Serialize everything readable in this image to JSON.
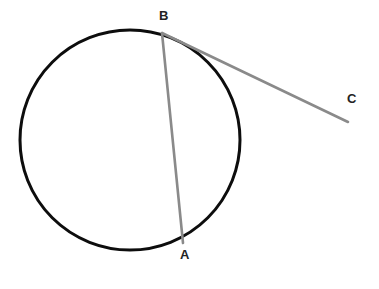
{
  "figure": {
    "background_color": "#ffffff",
    "width": 379,
    "height": 289
  },
  "style": {
    "circle_stroke_color": "#0d0d0d",
    "circle_stroke_width": 3,
    "chord_stroke_color": "#8a8a8a",
    "chord_stroke_width": 2.6,
    "tangent_stroke_color": "#8a8a8a",
    "tangent_stroke_width": 2.6,
    "label_color": "#232323",
    "label_font_size": 13
  },
  "chart_data": {
    "type": "diagram",
    "shapes": [
      {
        "name": "circle",
        "kind": "circle",
        "cx": 130,
        "cy": 140,
        "r": 110,
        "stroke": "#0d0d0d",
        "stroke_width": 3,
        "fill": "none"
      },
      {
        "name": "chord-BA",
        "kind": "line",
        "from": "B",
        "to": "A",
        "x1": 162,
        "y1": 33,
        "x2": 183,
        "y2": 243,
        "stroke": "#8a8a8a",
        "stroke_width": 2.6
      },
      {
        "name": "tangent-BC",
        "kind": "line",
        "from": "B",
        "to": "C",
        "x1": 162,
        "y1": 33,
        "x2": 348,
        "y2": 122,
        "stroke": "#8a8a8a",
        "stroke_width": 2.6
      }
    ],
    "points": [
      {
        "id": "A",
        "label": "A",
        "x": 183,
        "y": 243,
        "on_circle": true,
        "label_x": 185,
        "label_y": 259
      },
      {
        "id": "B",
        "label": "B",
        "x": 162,
        "y": 33,
        "on_circle": true,
        "label_x": 164,
        "label_y": 20
      },
      {
        "id": "C",
        "label": "C",
        "x": 348,
        "y": 122,
        "on_circle": false,
        "label_x": 352,
        "label_y": 103
      }
    ],
    "xlabel": "",
    "ylabel": "",
    "grid": false,
    "legend": false
  },
  "labels": {
    "a": "A",
    "b": "B",
    "c": "C"
  }
}
